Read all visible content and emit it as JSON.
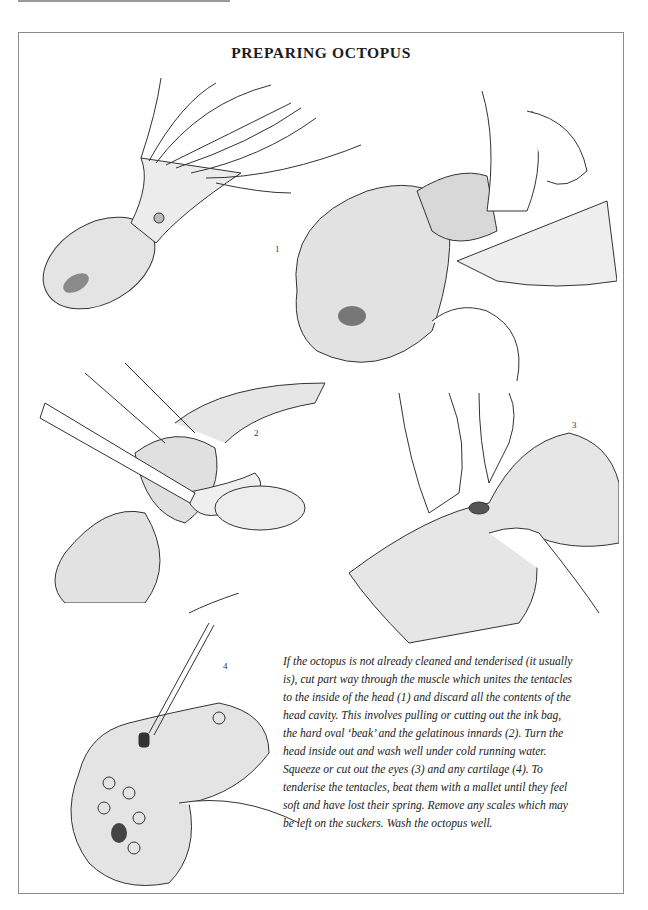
{
  "page": {
    "title": "PREPARING OCTOPUS"
  },
  "figures": [
    {
      "id": "whole",
      "label": "",
      "description": "Whole raw octopus with tentacles spread"
    },
    {
      "id": "fig1",
      "label": "1",
      "description": "Hands cutting through muscle joining tentacles to inside of head"
    },
    {
      "id": "fig2",
      "label": "2",
      "description": "Knife removing ink bag, beak and innards from head cavity"
    },
    {
      "id": "fig3",
      "label": "3",
      "description": "Fingers squeezing out the eyes"
    },
    {
      "id": "fig4",
      "label": "4",
      "description": "Knife removing cartilage; underside with suckers visible"
    }
  ],
  "body_text": {
    "lines": [
      "If the octopus is not already cleaned and tenderised (it usually",
      "is), cut part way through the muscle which unites the tentacles",
      "to the inside of the head (1) and discard all the contents of the",
      "head cavity. This involves pulling or cutting out the ink bag,",
      "the hard oval ‘beak’ and the gelatinous innards (2). Turn the",
      "head inside out and wash well under cold running water.",
      "Squeeze or cut out the eyes (3) and any cartilage (4). To",
      "tenderise the tentacles, beat them with a mallet until they feel",
      "soft and have lost their spring. Remove any scales which may",
      "be left on the suckers. Wash the octopus well."
    ]
  },
  "colors": {
    "ink": "#1a1a1a",
    "frame": "#8c8c8c",
    "paper": "#ffffff"
  }
}
